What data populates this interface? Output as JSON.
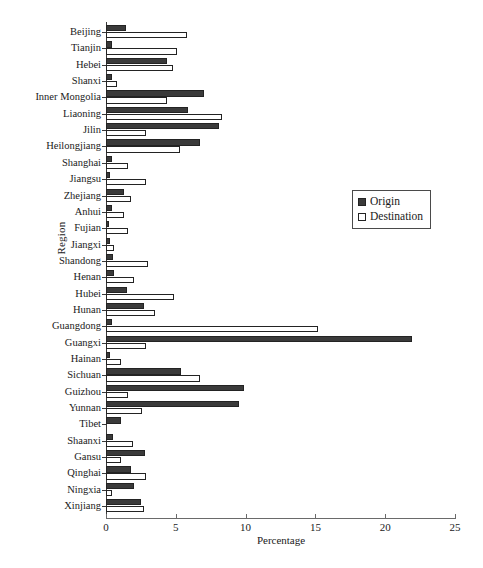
{
  "chart_data": {
    "type": "bar",
    "orientation": "horizontal",
    "title": "",
    "xlabel": "Percentage",
    "ylabel": "Region",
    "xlim": [
      0,
      25
    ],
    "xticks": [
      0,
      5,
      10,
      15,
      20,
      25
    ],
    "grid": false,
    "legend_position": "center-right",
    "categories": [
      "Beijing",
      "Tianjin",
      "Hebei",
      "Shanxi",
      "Inner Mongolia",
      "Liaoning",
      "Jilin",
      "Heilongjiang",
      "Shanghai",
      "Jiangsu",
      "Zhejiang",
      "Anhui",
      "Fujian",
      "Jiangxi",
      "Shandong",
      "Henan",
      "Hubei",
      "Hunan",
      "Guangdong",
      "Guangxi",
      "Hainan",
      "Sichuan",
      "Guizhou",
      "Yunnan",
      "Tibet",
      "Shaanxi",
      "Gansu",
      "Qinghai",
      "Ningxia",
      "Xinjiang"
    ],
    "series": [
      {
        "name": "Origin",
        "color": "#3a3a3a",
        "values": [
          1.4,
          0.4,
          4.4,
          0.4,
          7.0,
          5.9,
          8.1,
          6.7,
          0.4,
          0.3,
          1.3,
          0.4,
          0.2,
          0.3,
          0.5,
          0.6,
          1.5,
          2.7,
          0.4,
          21.9,
          0.3,
          5.4,
          9.9,
          9.5,
          1.1,
          0.5,
          2.8,
          1.8,
          2.0,
          2.5
        ]
      },
      {
        "name": "Destination",
        "color": "#ffffff",
        "values": [
          5.8,
          5.1,
          4.8,
          0.8,
          4.4,
          8.3,
          2.9,
          5.3,
          1.6,
          2.9,
          1.8,
          1.3,
          1.6,
          0.6,
          3.0,
          2.0,
          4.9,
          3.5,
          15.2,
          2.9,
          1.1,
          6.7,
          1.6,
          2.6,
          0.0,
          1.9,
          1.1,
          2.9,
          0.4,
          2.7
        ]
      }
    ]
  },
  "legend": {
    "items": [
      {
        "label": "Origin"
      },
      {
        "label": "Destination"
      }
    ]
  }
}
